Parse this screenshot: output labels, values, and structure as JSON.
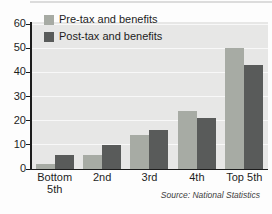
{
  "chart_data": {
    "type": "bar",
    "title": "",
    "categories": [
      "Bottom 5th",
      "2nd",
      "3rd",
      "4th",
      "Top 5th"
    ],
    "series": [
      {
        "name": "Pre-tax and benefits",
        "color": "#a7aba4",
        "values": [
          2,
          6,
          14,
          24,
          50
        ]
      },
      {
        "name": "Post-tax and benefits",
        "color": "#595b5a",
        "values": [
          6,
          10,
          16,
          21,
          43
        ]
      }
    ],
    "xlabel": "",
    "ylabel": "",
    "ylim": [
      0,
      60
    ],
    "yticks": [
      0,
      10,
      20,
      30,
      40,
      50,
      60
    ],
    "grid": true,
    "legend_position": "top-left-inside",
    "source": "Source: National Statistics"
  },
  "colors": {
    "page_bg": "#fdfdfd",
    "plot_bg": "#e7e7e6",
    "gridline": "#f8f8f8",
    "axis": "#1c1c1c",
    "label_text": "#1d1d1d",
    "source_text": "#3d3d3d",
    "top_rule": "#dcdcdc"
  }
}
